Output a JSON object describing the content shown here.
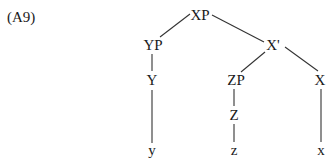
{
  "example_label": "(A9)",
  "tree": {
    "nodes": {
      "XP": {
        "label": "XP",
        "x": 200,
        "y": 20
      },
      "YP": {
        "label": "YP",
        "x": 153,
        "y": 50
      },
      "Xbar": {
        "label": "X'",
        "x": 273,
        "y": 50
      },
      "Y": {
        "label": "Y",
        "x": 152,
        "y": 85
      },
      "ZP": {
        "label": "ZP",
        "x": 236,
        "y": 85
      },
      "X": {
        "label": "X",
        "x": 320,
        "y": 85
      },
      "Z": {
        "label": "Z",
        "x": 234,
        "y": 120
      },
      "y_leaf": {
        "label": "y",
        "x": 152,
        "y": 155
      },
      "z_leaf": {
        "label": "z",
        "x": 234,
        "y": 155
      },
      "x_leaf": {
        "label": "x",
        "x": 321,
        "y": 155
      }
    },
    "edges": [
      [
        "XP",
        "YP"
      ],
      [
        "XP",
        "Xbar"
      ],
      [
        "YP",
        "Y"
      ],
      [
        "Y",
        "y_leaf"
      ],
      [
        "Xbar",
        "ZP"
      ],
      [
        "Xbar",
        "X"
      ],
      [
        "ZP",
        "Z"
      ],
      [
        "Z",
        "z_leaf"
      ],
      [
        "X",
        "x_leaf"
      ]
    ]
  },
  "colors": {
    "text": "#1a1a1a",
    "line": "#333333",
    "background": "#ffffff"
  }
}
